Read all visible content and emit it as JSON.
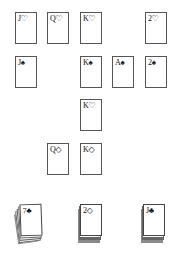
{
  "board": {
    "background": "#ffffff",
    "card_border": "#555555",
    "rows": [
      {
        "cards": [
          {
            "rank": "J",
            "suit": "♡",
            "label": "J♡",
            "x": 15,
            "y": 12
          },
          {
            "rank": "Q",
            "suit": "♡",
            "label": "Q♡",
            "x": 47,
            "y": 12
          },
          {
            "rank": "K",
            "suit": "♡",
            "label": "K♡",
            "x": 80,
            "y": 12
          },
          {
            "rank": "2",
            "suit": "♡",
            "label": "2♡",
            "x": 145,
            "y": 12
          }
        ]
      },
      {
        "cards": [
          {
            "rank": "J",
            "suit": "♠",
            "label": "J♠",
            "x": 15,
            "y": 56
          },
          {
            "rank": "K",
            "suit": "♠",
            "label": "K♠",
            "x": 80,
            "y": 56
          },
          {
            "rank": "A",
            "suit": "♠",
            "label": "A♠",
            "x": 112,
            "y": 56
          },
          {
            "rank": "2",
            "suit": "♠",
            "label": "2♠",
            "x": 145,
            "y": 56
          }
        ]
      },
      {
        "cards": [
          {
            "rank": "K",
            "suit": "♡",
            "label": "K♡",
            "x": 80,
            "y": 99
          }
        ]
      },
      {
        "cards": [
          {
            "rank": "Q",
            "suit": "◇",
            "label": "Q◇",
            "x": 47,
            "y": 143
          },
          {
            "rank": "K",
            "suit": "◇",
            "label": "K◇",
            "x": 80,
            "y": 143
          }
        ]
      }
    ]
  },
  "stacks": [
    {
      "name": "left-stack",
      "top_card": {
        "rank": "7",
        "suit": "♣",
        "label": "7♣"
      },
      "style": "fanned"
    },
    {
      "name": "middle-stack",
      "top_card": {
        "rank": "2",
        "suit": "◇",
        "label": "2◇"
      },
      "style": "straight"
    },
    {
      "name": "right-stack",
      "top_card": {
        "rank": "J",
        "suit": "♣",
        "label": "J♣"
      },
      "style": "straight"
    }
  ]
}
